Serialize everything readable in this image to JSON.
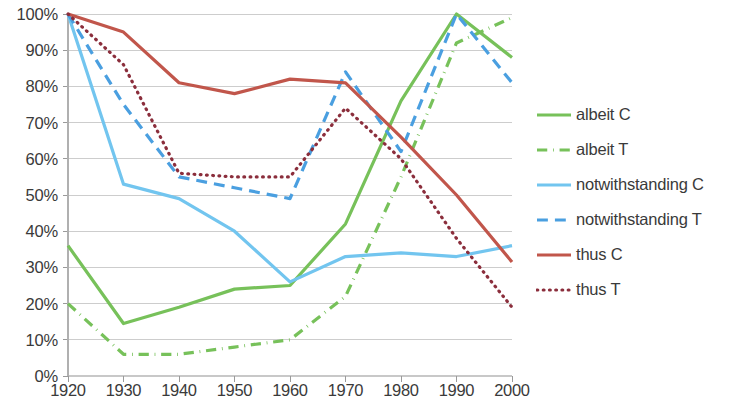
{
  "chart_data": {
    "type": "line",
    "title": "",
    "xlabel": "",
    "ylabel": "",
    "x": [
      1920,
      1930,
      1940,
      1950,
      1960,
      1970,
      1980,
      1990,
      2000
    ],
    "categories": [
      "1920",
      "1930",
      "1940",
      "1950",
      "1960",
      "1970",
      "1980",
      "1990",
      "2000"
    ],
    "xlim": [
      1920,
      2000
    ],
    "ylim": [
      0,
      100
    ],
    "y_ticks": [
      0,
      10,
      20,
      30,
      40,
      50,
      60,
      70,
      80,
      90,
      100
    ],
    "y_tick_labels": [
      "0%",
      "10%",
      "20%",
      "30%",
      "40%",
      "50%",
      "60%",
      "70%",
      "80%",
      "90%",
      "100%"
    ],
    "grid": true,
    "legend_position": "right",
    "value_suffix": "%",
    "series": [
      {
        "name": "albeit C",
        "color": "#77C15A",
        "style": "solid",
        "values": [
          36,
          14.5,
          19,
          24,
          25,
          42,
          76,
          100,
          88
        ]
      },
      {
        "name": "albeit T",
        "color": "#77C15A",
        "style": "dashdot",
        "values": [
          20,
          6,
          6,
          8,
          10,
          22,
          55,
          92,
          99
        ]
      },
      {
        "name": "notwithstanding C",
        "color": "#72C5EF",
        "style": "solid",
        "values": [
          100,
          53,
          49,
          40,
          26,
          33,
          34,
          33,
          36
        ]
      },
      {
        "name": "notwithstanding T",
        "color": "#4A9FE0",
        "style": "dashed",
        "values": [
          100,
          75,
          55,
          52,
          49,
          84,
          62,
          100,
          81
        ]
      },
      {
        "name": "thus C",
        "color": "#C1564B",
        "style": "solid",
        "values": [
          100,
          95,
          81,
          78,
          82,
          81,
          66,
          50,
          31.5
        ]
      },
      {
        "name": "thus T",
        "color": "#8B2E3C",
        "style": "dotted",
        "values": [
          100,
          86,
          56,
          55,
          55,
          74,
          60,
          38,
          19
        ]
      }
    ]
  },
  "legend": {
    "items": [
      {
        "label": "albeit C"
      },
      {
        "label": "albeit T"
      },
      {
        "label": "notwithstanding C"
      },
      {
        "label": "notwithstanding T"
      },
      {
        "label": "thus C"
      },
      {
        "label": "thus T"
      }
    ]
  }
}
